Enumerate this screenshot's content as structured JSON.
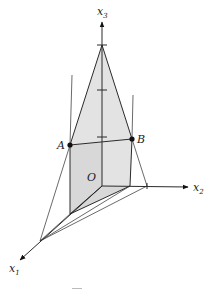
{
  "diagram": {
    "type": "3d-coordinate-sketch",
    "axes": {
      "x1": {
        "label": "x",
        "subscript": "1"
      },
      "x2": {
        "label": "x",
        "subscript": "2"
      },
      "x3": {
        "label": "x",
        "subscript": "3"
      }
    },
    "points": {
      "A": {
        "label": "A"
      },
      "B": {
        "label": "B"
      },
      "O": {
        "label": "O"
      }
    },
    "x3_tick_count": 3,
    "colors": {
      "line": "#2a2a2a",
      "shading": "#e3e3e3",
      "background": "#ffffff"
    }
  }
}
